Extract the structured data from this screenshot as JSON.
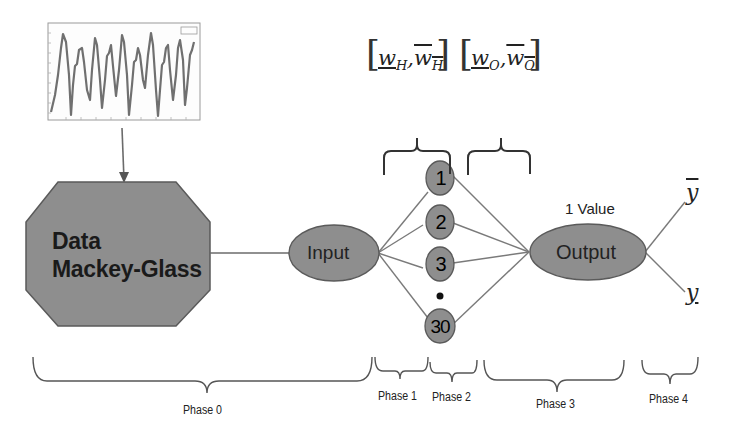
{
  "diagram": {
    "type": "neural-network-pipeline",
    "inset_chart": {
      "name": "Mackey-Glass time series plot",
      "legend_label": "Data"
    },
    "data_block": {
      "line1": "Data",
      "line2": "Mackey-Glass"
    },
    "input_node": {
      "label": "Input"
    },
    "hidden_nodes": [
      {
        "label": "1"
      },
      {
        "label": "2"
      },
      {
        "label": "3"
      },
      {
        "label": "30"
      }
    ],
    "ellipsis_dot": "•",
    "output_node": {
      "label": "Output",
      "annotation": "1 Value"
    },
    "outputs": {
      "upper": "y",
      "lower": "y"
    },
    "weight_intervals": {
      "hidden": {
        "lower": "w",
        "lower_sub": "H",
        "upper": "w",
        "upper_sub": "H"
      },
      "output": {
        "lower": "w",
        "lower_sub": "O",
        "upper": "w",
        "upper_sub": "O"
      }
    },
    "phases": [
      {
        "label": "Phase 0"
      },
      {
        "label": "Phase 1"
      },
      {
        "label": "Phase 2"
      },
      {
        "label": "Phase 3"
      },
      {
        "label": "Phase 4"
      }
    ],
    "colors": {
      "node_fill": "#8c8c8c",
      "node_stroke": "#5a5a5a",
      "line": "#7a7a7a",
      "text": "#222222"
    }
  }
}
